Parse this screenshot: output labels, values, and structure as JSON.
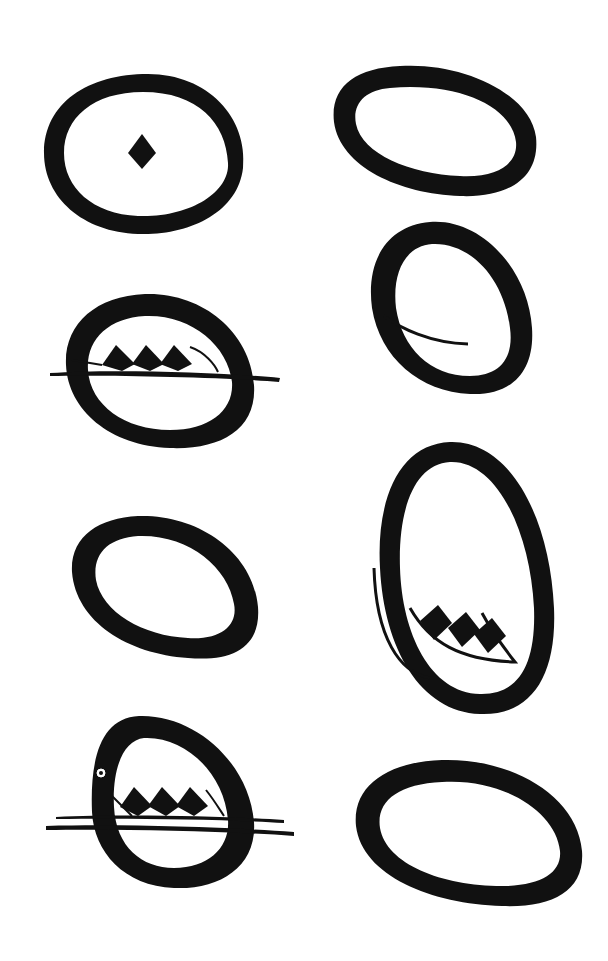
{
  "page": {
    "background": "#ffffff",
    "ink": "#111111"
  },
  "figures": [
    {
      "id": "ring-with-diamond",
      "column": "left",
      "row": 1,
      "motif": "single-diamond"
    },
    {
      "id": "plain-ring-1",
      "column": "right",
      "row": 1,
      "motif": "none"
    },
    {
      "id": "ring-with-inner-curve",
      "column": "right",
      "row": 2,
      "motif": "inner-curve"
    },
    {
      "id": "ring-with-bar-and-triple-diamonds",
      "column": "left",
      "row": 2,
      "motif": "three-diamonds-on-line"
    },
    {
      "id": "plain-ring-2",
      "column": "left",
      "row": 3,
      "motif": "none"
    },
    {
      "id": "tall-ring-with-triple-diamonds",
      "column": "right",
      "row": 3,
      "motif": "three-diamonds-in-crescent"
    },
    {
      "id": "ring-with-eye-and-double-bars",
      "column": "left",
      "row": 4,
      "motif": "three-diamonds-on-double-line-with-eye"
    },
    {
      "id": "plain-ring-3",
      "column": "right",
      "row": 4,
      "motif": "none"
    }
  ]
}
